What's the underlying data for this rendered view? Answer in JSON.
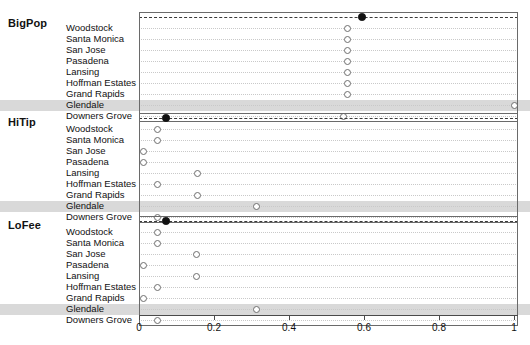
{
  "figure": {
    "type": "dot-plot",
    "panels_order": [
      "BigPop",
      "HiTip",
      "LoFee"
    ]
  },
  "axis": {
    "min": 0,
    "max": 1,
    "ticks": [
      0,
      0.2,
      0.4,
      0.6,
      0.8,
      1
    ],
    "tick_labels": [
      "0",
      "0.2",
      "0.4",
      "0.6",
      "0.8",
      "1"
    ]
  },
  "highlight_row": "Glendale",
  "colors": {
    "reference_dot": "#111111",
    "city_dot_stroke": "#6e6e6e",
    "highlight_band": "#d9d9d9",
    "gridline": "#c9c9c9",
    "reference_gridline": "#3a3a3a",
    "frame": "#6a6a6a"
  },
  "chart_data": {
    "type": "scatter",
    "title": "",
    "xlabel": "",
    "ylabel": "",
    "xlim": [
      0,
      1
    ],
    "grid": true,
    "legend": "none",
    "categories": [
      "Woodstock",
      "Santa Monica",
      "San Jose",
      "Pasadena",
      "Lansing",
      "Hoffman Estates",
      "Grand Rapids",
      "Glendale",
      "Downers Grove"
    ],
    "panels": [
      {
        "name": "BigPop",
        "reference": {
          "label": "",
          "value": 0.594,
          "marker": "filled"
        },
        "values": [
          0.555,
          0.555,
          0.555,
          0.555,
          0.555,
          0.555,
          0.555,
          1.0,
          0.545
        ]
      },
      {
        "name": "HiTip",
        "reference": {
          "label": "",
          "value": 0.072,
          "marker": "filled"
        },
        "values": [
          0.048,
          0.048,
          0.011,
          0.011,
          0.157,
          0.048,
          0.157,
          0.312,
          0.048
        ]
      },
      {
        "name": "LoFee",
        "reference": {
          "label": "",
          "value": 0.072,
          "marker": "filled"
        },
        "values": [
          0.048,
          0.048,
          0.152,
          0.011,
          0.152,
          0.048,
          0.011,
          0.312,
          0.048
        ]
      }
    ]
  }
}
